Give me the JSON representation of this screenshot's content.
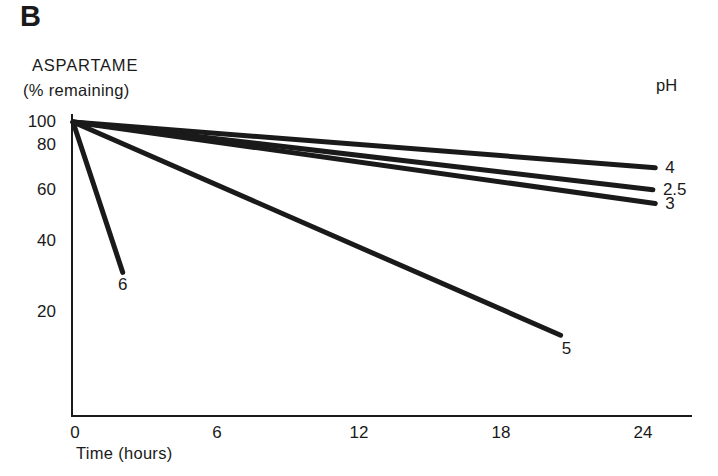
{
  "figure": {
    "panel_label": "B",
    "y_axis_title_line1": "ASPARTAME",
    "y_axis_title_line2": "(% remaining)",
    "x_axis_title": "Time (hours)",
    "legend_title": "pH"
  },
  "colors": {
    "ink": "#1a1a1a",
    "background": "#ffffff"
  },
  "chart_data": {
    "type": "line",
    "xlabel": "Time (hours)",
    "ylabel": "ASPARTAME (% remaining)",
    "x_ticks": [
      0,
      6,
      12,
      18,
      24
    ],
    "y_ticks": [
      100,
      80,
      60,
      40,
      20
    ],
    "y_scale": "log",
    "xlim": [
      0,
      26
    ],
    "ylim": [
      10,
      100
    ],
    "grid": false,
    "legend_position": "top-right",
    "series": [
      {
        "name": "pH 4",
        "label": "4",
        "points": [
          [
            0,
            100
          ],
          [
            24.6,
            70
          ]
        ]
      },
      {
        "name": "pH 2.5",
        "label": "2.5",
        "points": [
          [
            0,
            100
          ],
          [
            24.5,
            59
          ]
        ]
      },
      {
        "name": "pH 3",
        "label": "3",
        "points": [
          [
            0,
            100
          ],
          [
            24.6,
            53
          ]
        ]
      },
      {
        "name": "pH 6",
        "label": "6",
        "points": [
          [
            0,
            100
          ],
          [
            2.1,
            31
          ]
        ]
      },
      {
        "name": "pH 5",
        "label": "5",
        "points": [
          [
            0,
            100
          ],
          [
            20.6,
            19
          ]
        ]
      }
    ]
  }
}
